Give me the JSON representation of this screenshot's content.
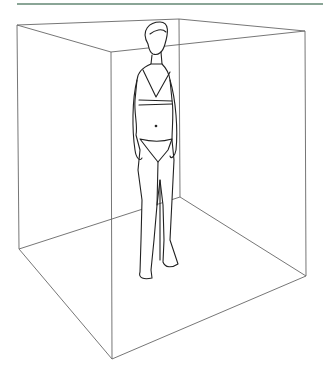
{
  "illustration": {
    "subject": "standing human figure in underwear inside a wireframe cube",
    "colors": {
      "line": "#555555",
      "figure": "#222222",
      "top_rule": "#8aa596",
      "background": "#ffffff"
    },
    "box": {
      "back_top_left": [
        17,
        25
      ],
      "back_top": [
        179,
        19
      ],
      "top_right": [
        305,
        31
      ],
      "front_top": [
        111,
        52
      ],
      "bottom_left": [
        19,
        249
      ],
      "back_bottom": [
        180,
        197
      ],
      "bottom_right": [
        306,
        276
      ],
      "front_bottom": [
        112,
        359
      ]
    }
  }
}
